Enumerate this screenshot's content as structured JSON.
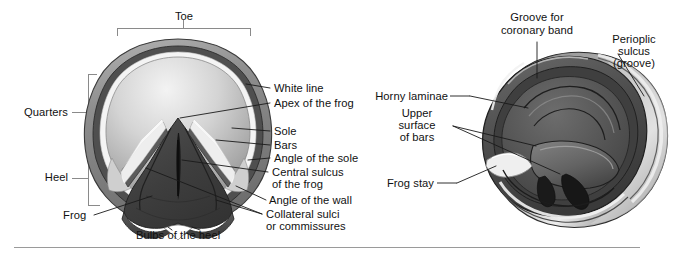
{
  "figure": {
    "divider": "horizontal-rule"
  },
  "colors": {
    "wall_outer": "#8d8d8d",
    "wall_dark": "#4a4a4a",
    "white_line": "#f2f2f2",
    "sole_light": "#e3e3e3",
    "sole_mid": "#9c9c9c",
    "frog_dark": "#3c3c3c",
    "frog_mid": "#555555",
    "leader": "#1a1a1a",
    "bracket": "#8a8a8a",
    "rule": "#9a9a9a",
    "text": "#111111"
  },
  "left_diagram": {
    "name": "ground-surface-of-hoof",
    "bracket_labels": [
      {
        "id": "toe",
        "text": "Toe"
      },
      {
        "id": "quarters",
        "text": "Quarters"
      },
      {
        "id": "heel",
        "text": "Heel"
      }
    ],
    "labels": [
      {
        "id": "white-line",
        "text": "White line"
      },
      {
        "id": "apex-of-the-frog",
        "text": "Apex of the frog"
      },
      {
        "id": "sole",
        "text": "Sole"
      },
      {
        "id": "bars",
        "text": "Bars"
      },
      {
        "id": "angle-of-the-sole",
        "text": "Angle of the sole"
      },
      {
        "id": "central-sulcus-1",
        "text": "Central sulcus"
      },
      {
        "id": "central-sulcus-2",
        "text": "of the frog"
      },
      {
        "id": "angle-of-the-wall",
        "text": "Angle of the wall"
      },
      {
        "id": "collateral-sulci-1",
        "text": "Collateral sulci"
      },
      {
        "id": "collateral-sulci-2",
        "text": "or commissures"
      },
      {
        "id": "frog",
        "text": "Frog"
      },
      {
        "id": "bulbs-of-the-heel",
        "text": "Bulbs of the heel"
      }
    ]
  },
  "right_diagram": {
    "name": "upper-surface-of-hoof",
    "labels": [
      {
        "id": "groove-coronary-1",
        "text": "Groove for"
      },
      {
        "id": "groove-coronary-2",
        "text": "coronary band"
      },
      {
        "id": "perioplic-1",
        "text": "Perioplic"
      },
      {
        "id": "perioplic-2",
        "text": "sulcus"
      },
      {
        "id": "perioplic-3",
        "text": "(groove)"
      },
      {
        "id": "horny-laminae",
        "text": "Horny laminae"
      },
      {
        "id": "upper-surface-1",
        "text": "Upper"
      },
      {
        "id": "upper-surface-2",
        "text": "surface"
      },
      {
        "id": "upper-surface-3",
        "text": "of bars"
      },
      {
        "id": "frog-stay",
        "text": "Frog stay"
      }
    ]
  }
}
